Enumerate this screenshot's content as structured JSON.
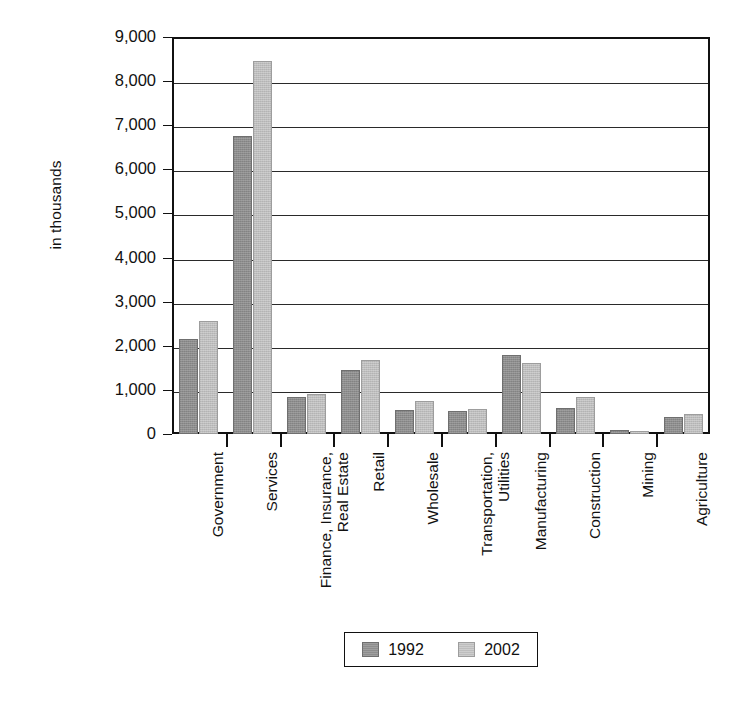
{
  "chart_data": {
    "type": "bar",
    "title": "",
    "subtitle": "",
    "xlabel": "",
    "ylabel": "in thousands",
    "ylim": [
      0,
      9000
    ],
    "ytick_labels": [
      "9,000",
      "8,000",
      "7,000",
      "6,000",
      "5,000",
      "4,000",
      "3,000",
      "2,000",
      "1,000",
      "0"
    ],
    "ytick_values": [
      9000,
      8000,
      7000,
      6000,
      5000,
      4000,
      3000,
      2000,
      1000,
      0
    ],
    "grid": true,
    "legend_position": "bottom",
    "categories": [
      "Government",
      "Services",
      "Finance, Insurance,\nReal Estate",
      "Retail",
      "Wholesale",
      "Transportation,\nUtilities",
      "Manufacturing",
      "Construction",
      "Mining",
      "Agriculture"
    ],
    "series": [
      {
        "name": "1992",
        "color": "#8d8d8d",
        "values": [
          2150,
          6750,
          830,
          1450,
          550,
          530,
          1800,
          600,
          100,
          390
        ]
      },
      {
        "name": "2002",
        "color": "#bdbdbd",
        "values": [
          2560,
          8450,
          900,
          1670,
          740,
          570,
          1620,
          850,
          70,
          450
        ]
      }
    ]
  },
  "legend": {
    "entries": [
      {
        "label": "1992"
      },
      {
        "label": "2002"
      }
    ]
  }
}
